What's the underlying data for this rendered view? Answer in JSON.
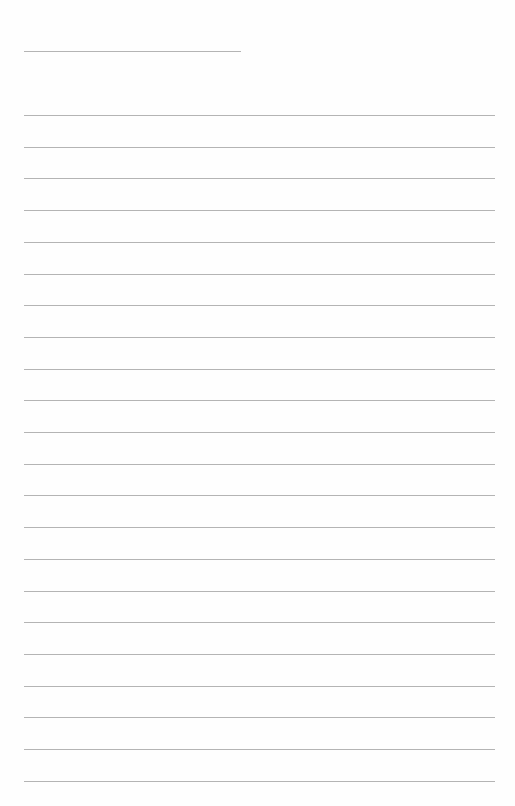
{
  "page": {
    "type": "blank lined writing sheet",
    "header_line": {
      "top": 51,
      "left": 24,
      "width": 217
    },
    "ruled_lines": {
      "count": 22,
      "first_top": 115,
      "spacing": 31.7,
      "left": 24,
      "width": 471
    },
    "line_color": "#b4b4b4",
    "background": "#fefefe",
    "text": ""
  }
}
